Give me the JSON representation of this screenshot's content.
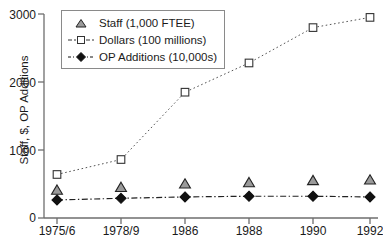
{
  "chart_data": {
    "type": "line",
    "title": "",
    "xlabel": "",
    "ylabel": "Staff, $, OP Additions",
    "categories": [
      "1975/6",
      "1978/9",
      "1986",
      "1988",
      "1990",
      "1992"
    ],
    "ylim": [
      0,
      3000
    ],
    "yticks": [
      0,
      1000,
      2000,
      3000
    ],
    "ytick_labels": [
      "0",
      "1000",
      "2000",
      "3000"
    ],
    "grid": false,
    "legend_position": "upper left",
    "series": [
      {
        "name": "Staff (1,000 FTEE)",
        "marker": "triangle",
        "marker_fill": "#9a9a9a",
        "marker_edge": "#222222",
        "line_style": "none",
        "values": [
          410,
          450,
          500,
          520,
          550,
          560
        ]
      },
      {
        "name": "Dollars (100 millions)",
        "marker": "square-open",
        "marker_fill": "#ffffff",
        "marker_edge": "#333333",
        "line_style": "dotted",
        "values": [
          640,
          860,
          1850,
          2280,
          2800,
          2950
        ]
      },
      {
        "name": "OP Additions (10,000s)",
        "marker": "diamond-filled",
        "marker_fill": "#111111",
        "marker_edge": "#111111",
        "line_style": "dashdot",
        "values": [
          265,
          290,
          310,
          320,
          320,
          310
        ]
      }
    ]
  },
  "legend": {
    "entries": [
      {
        "label": "Staff (1,000 FTEE)"
      },
      {
        "label": "Dollars (100 millions)"
      },
      {
        "label": "OP Additions (10,000s)"
      }
    ]
  },
  "axis": {
    "y_title": "Staff, $, OP Additions",
    "y_labels": [
      "3000",
      "2000",
      "1000",
      "0"
    ],
    "x_labels": [
      "1975/6",
      "1978/9",
      "1986",
      "1988",
      "1990",
      "1992"
    ]
  },
  "colors": {
    "axis": "#6e6e6e",
    "text": "#1a1a1a",
    "staff_marker": "#9a9a9a",
    "dollars_marker": "#ffffff",
    "op_marker": "#111111",
    "legend_border": "#8a8a8a",
    "background": "#ffffff"
  }
}
